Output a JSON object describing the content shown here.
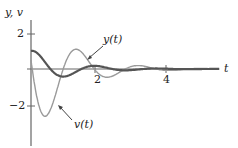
{
  "chart_data": {
    "type": "line",
    "title": "",
    "xlabel": "t",
    "ylabel": "y, v",
    "x_ticks": [
      2,
      4
    ],
    "y_ticks": [
      2,
      -2
    ],
    "xlim": [
      0,
      5.3
    ],
    "ylim": [
      -4.2,
      2.6
    ],
    "grid": false,
    "legend": "annotations",
    "series": [
      {
        "name": "y(t)",
        "color": "#555555",
        "stroke_width": 2.2,
        "description": "damped oscillation starting at ~1.0, decaying to 0",
        "x": [
          0,
          0.25,
          0.5,
          0.75,
          1.0,
          1.25,
          1.5,
          1.75,
          2.0,
          2.5,
          3.0,
          3.5,
          4.0
        ],
        "values": [
          1.0,
          0.79,
          0.16,
          -0.34,
          -0.45,
          -0.21,
          0.09,
          0.21,
          0.13,
          -0.06,
          0.03,
          -0.01,
          0.0
        ]
      },
      {
        "name": "v(t)",
        "color": "#9a9a9a",
        "stroke_width": 1.4,
        "description": "derivative of y; min ~ -4 near t=0.35, max ~ 2.1 near t=0.9",
        "x": [
          0,
          0.2,
          0.35,
          0.5,
          0.7,
          0.9,
          1.1,
          1.3,
          1.5,
          1.8,
          2.2,
          2.6,
          3.0,
          3.5,
          4.0
        ],
        "values": [
          0.5,
          -3.2,
          -4.0,
          -3.0,
          -0.3,
          2.1,
          1.6,
          0.2,
          -0.9,
          -0.6,
          0.4,
          0.5,
          -0.2,
          0.1,
          0.0
        ]
      }
    ],
    "annotations": [
      {
        "text": "y(t)",
        "points_to": "y(t) curve near t≈1.6"
      },
      {
        "text": "v(t)",
        "points_to": "v(t) curve near t≈0.55"
      }
    ],
    "model": {
      "decay": 1.0,
      "omega": 3.6,
      "y0": 1.0,
      "v0": 0.5
    }
  },
  "labels": {
    "y_axis": "y, v",
    "x_axis": "t",
    "tick_y_pos": "2",
    "tick_y_neg": "−2",
    "tick_x_2": "2",
    "tick_x_4": "4",
    "ann_y": "y(t)",
    "ann_v": "v(t)"
  }
}
